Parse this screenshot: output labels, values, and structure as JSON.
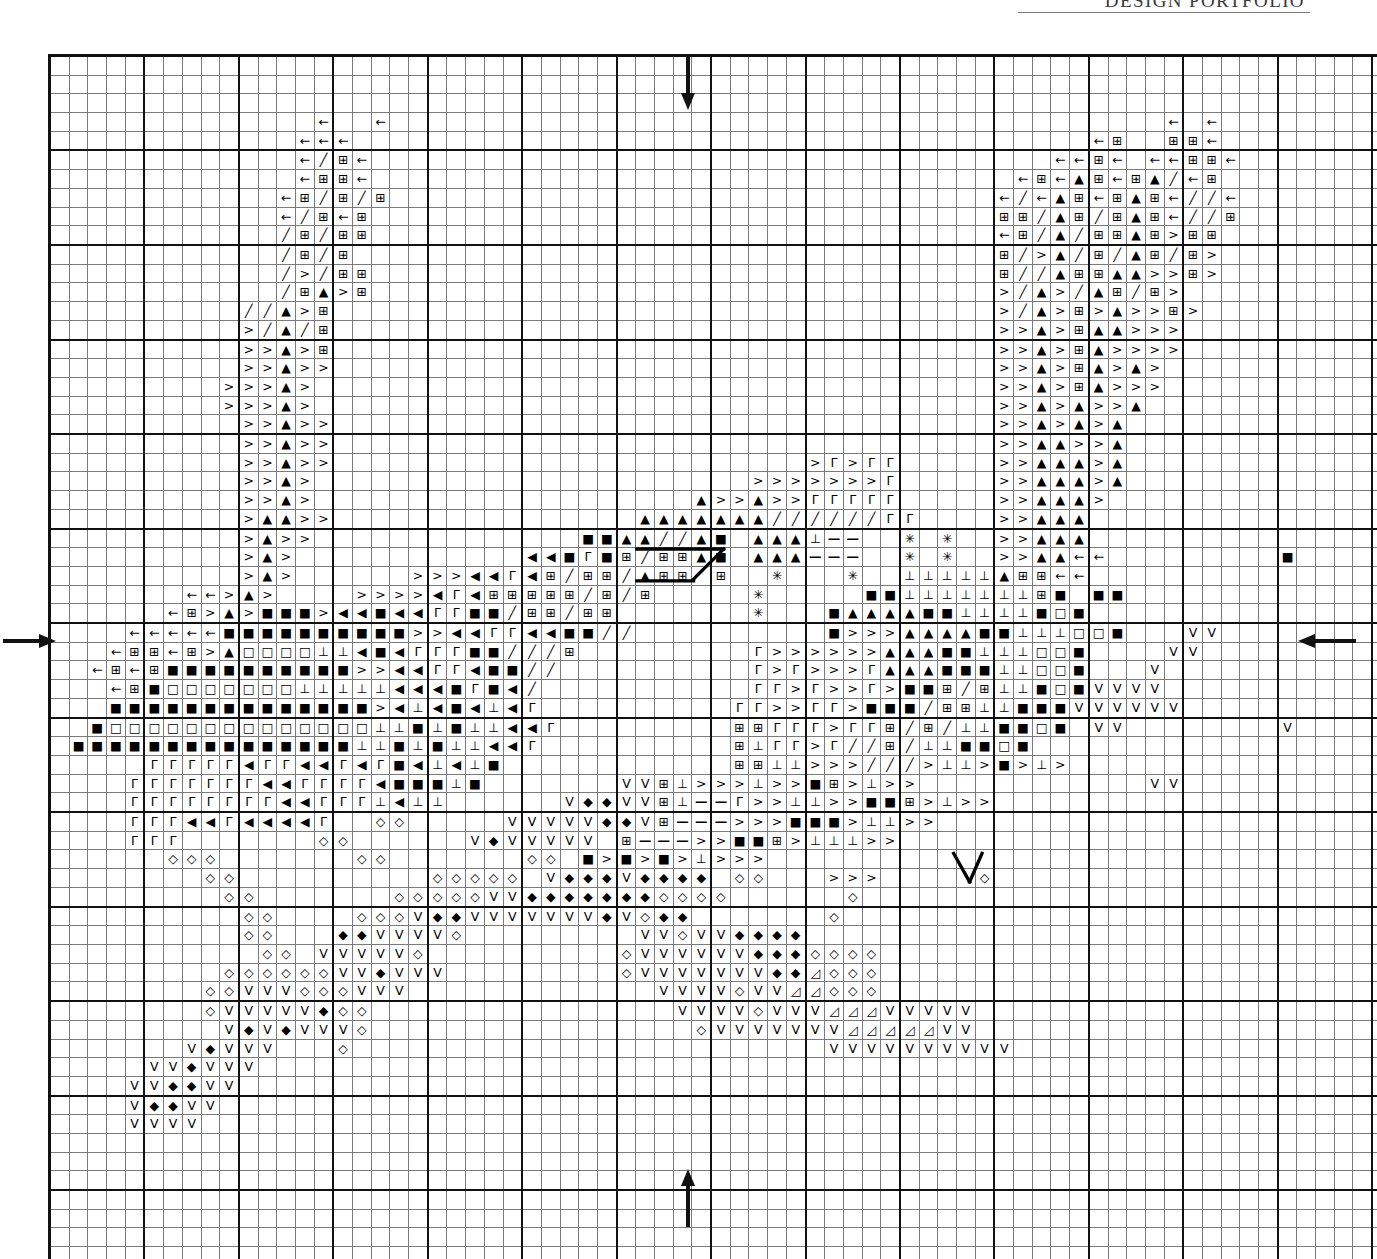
{
  "header": {
    "title": "DESIGN PORTFOLIO"
  },
  "chart_meta": {
    "type": "cross-stitch-chart",
    "columns": 71,
    "rows": 66,
    "cell_px": 17.7,
    "bold_every": 5,
    "grid_line_color": "#7b7b7b",
    "bold_line_color": "#111111",
    "background": "#ffffff",
    "symbol_legend": [
      {
        "key": "<",
        "glyph": "←",
        "name": "left-arrow-symbol"
      },
      {
        "key": "#",
        "glyph": "⊞",
        "name": "boxed-plus-symbol"
      },
      {
        "key": "/",
        "glyph": "╱",
        "name": "slash-symbol"
      },
      {
        "key": "A",
        "glyph": "▲",
        "name": "filled-up-triangle-symbol"
      },
      {
        "key": ">",
        "glyph": ">",
        "name": "greater-than-symbol"
      },
      {
        "key": "B",
        "glyph": "■",
        "name": "filled-square-symbol"
      },
      {
        "key": "O",
        "glyph": "□",
        "name": "open-square-symbol"
      },
      {
        "key": "L",
        "glyph": "◀",
        "name": "filled-left-triangle-symbol"
      },
      {
        "key": "G",
        "glyph": "Γ",
        "name": "gamma-symbol"
      },
      {
        "key": "T",
        "glyph": "⊥",
        "name": "perpendicular-symbol"
      },
      {
        "key": "-",
        "glyph": "—",
        "name": "dash-symbol"
      },
      {
        "key": "*",
        "glyph": "✳",
        "name": "asterisk-star-symbol"
      },
      {
        "key": "d",
        "glyph": "◇",
        "name": "open-diamond-symbol"
      },
      {
        "key": "D",
        "glyph": "◆",
        "name": "filled-diamond-symbol"
      },
      {
        "key": "V",
        "glyph": "V",
        "name": "vee-symbol"
      },
      {
        "key": "t",
        "glyph": "◿",
        "name": "small-open-triangle-symbol"
      }
    ],
    "center_markers": [
      {
        "name": "center-marker-top",
        "edge": "top",
        "direction": "down",
        "col": 36
      },
      {
        "name": "center-marker-bottom",
        "edge": "bottom",
        "direction": "up",
        "col": 36
      },
      {
        "name": "center-marker-left",
        "edge": "left",
        "direction": "right",
        "row": 33
      },
      {
        "name": "center-marker-right",
        "edge": "right",
        "direction": "left",
        "row": 33
      }
    ],
    "backstitch_lines": [
      {
        "name": "backstitch-diagonal-upper",
        "x1": 36.3,
        "y1": 29.5,
        "x2": 38.0,
        "y2": 27.8
      },
      {
        "name": "backstitch-horizontal-top",
        "x1": 33.1,
        "y1": 27.8,
        "x2": 38.0,
        "y2": 27.8
      },
      {
        "name": "backstitch-horizontal-bot",
        "x1": 33.1,
        "y1": 29.6,
        "x2": 36.3,
        "y2": 29.6
      },
      {
        "name": "backstitch-v-left",
        "x1": 51.0,
        "y1": 45.0,
        "x2": 51.9,
        "y2": 46.6
      },
      {
        "name": "backstitch-v-right",
        "x1": 51.9,
        "y1": 46.6,
        "x2": 52.6,
        "y2": 45.0
      }
    ]
  },
  "chart_data": {
    "type": "heatmap",
    "title": "DESIGN PORTFOLIO",
    "xlabel": "",
    "ylabel": "",
    "grid": true,
    "legend": "symbol-keyed floss chart",
    "rows": [
      ".......................................................................",
      ".......................................................................",
      ".......................................................................",
      "..............<..<.........................................<.<.........",
      ".............<<<.......................................<#..##<.........",
      ".............</#<....................................<<#<.<<##<........",
      ".............<##<..................................<#<A#<#A/<#........",
      "............<#/#/#................................</<A#<#A#<//<.......",
      "............</#<#.................................##/A#/#A#<//#.......",
      "............/#/##.................................<#/A/##A#>##.......",
      "............/#/#..................................#/>A/#/A#/#>.......",
      "............/>/##.................................#//A##AA>>#>.......",
      "............/#A>#.................................>/A>/A#/#>.........",
      "..........//A>#...................................>/A>#>A>>#>........",
      "..........>/A/#...................................>>A>#AA>>>.........",
      "..........>>A>#...................................>>A>#A>>>>.........",
      "..........>>A>>...................................>>A>#A>A>..........",
      ".........>>>A>....................................>>A>#A>>>..........",
      ".........>>>A>....................................>>A>A>>A...........",
      "..........>>A>>...................................>>A>A>A............",
      "..........>>A>>...................................>>AA>>A............",
      "..........>>A>>.........................>G>GG.....>>AAA>A............",
      "..........>>A>.......................>>>>>>>G.....>>AAA>A............",
      "..........>>A>....................A>>A>>GGGGG.....>>AAA>.............",
      "..........>AA>>................AAAAAAA//////GG....>>AAA..............",
      "..........>A>>..............BBAA//AB AAAT--7.*.*..>>AAA..............",
      "..........>A>............LLBGB#/##AB AAA---..*.*..>>AA<<.........B...",
      "..........>A>......>>>LLGL#/##/A##.#..*...*..TTTTTA##<<..............",
      ".......<<>A>....>>>>LGL#####/#/#.....*.....BBTTTTTTT#B.BB............",
      "......<#>A>BBB>LLBLLGGBB/##/##.......*...BAAAABBTTTTBOB.............",
      "....<<<<<BBBBBBBBBB>>LLGGLLBB//......... B>>>AAAABBTTTOOB...VV......",
      "...<##<#>AOOOOTTLBLGGGBB///#.........G>>>>>>AAABBTTTOOB....VV......",
      "..<#<#BBBBBBBBBB>>LLGGLBB//..........G>G>>>GAAABBBTTOOB...V........",
      "...<#BOOOOOOOTTTTTLLLBGBL/...........GG>G>>G>BB#/#TTBOBVVVV........",
      "...BBBBBBBBBBBBBB>LTLBLTLG..........GG>>GG>BBB/##TTBBBVVVVVV.......",
      "..BOOOOOOOOOOOOOOTTBTBTTLLG.........##GGG>GG#/#/TTBBOB.VV........V.",
      ".BBBBBBBBBBBBBBBTTBTBTTLLG..........#TGG>G//#/TTBBOB...............",
      ".....GGGGGLGGLLGLGBLTLTB............##TT>>>///>TT>B>T>.............",
      "....GGGGGGGLLGGGGLBBBTB.......VV#T>>>T>>B#>T>>............VV.......",
      "....GGGGGGGGLLGGGTLTT......VDDVV#T--G>>TT>>BB#>T>>................",
      "....GGGLLGLLLLG..dd.....VVVVVDDV#--->>>BBB>TT>>..................",
      "....GGG.......dd......VDVVVVV.#--->>BB#>TTT>>....................",
      "......ddd.......dd.......dd.B>B>B>T>>>.........................",
      "........dd..........ddddd.VDDDVDDDD.dd...>>>.....d.............",
      ".........dd.......dddddVVDDDDDDDdddd......d....................",
      "..........dd....dddVDDVVVVVVVDVdDD.......d.....................",
      "..........dd...DDVVVVd.........VVdVVDDDD......................",
      "...........dd.VVVVVd..........dVVVVVVDDDdddd..................",
      ".........ddddddVVDVVV.........dVVVVVVVDDtddd..................",
      "........ddVVVdddVVV.............VVVVdVVttddd..................",
      "........dVVVVVDdd................VVVVdVVVtttVVVVV.............",
      ".........VDVDVVVd.................dVVVVVVVtttttVV.............",
      ".......VDVVV...d.........................VVVVVVVVVV...........",
      ".....VVDVVV...................................................",
      "....VVDDVV....................................................",
      "....VDDVV.....................................................",
      "....VVVV......................................................",
      ".......................................................................",
      ".......................................................................",
      ".......................................................................",
      ".......................................................................",
      ".......................................................................",
      ".......................................................................",
      ".......................................................................",
      ".......................................................................",
      "......................................................................."
    ]
  }
}
